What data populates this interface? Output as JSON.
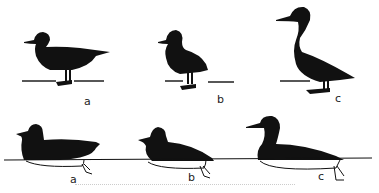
{
  "figure": {
    "ink_color": "#111111",
    "background": "#ffffff",
    "top_row": {
      "description": "Ducks standing on ground, side silhouette",
      "labels": [
        "a",
        "b",
        "c"
      ]
    },
    "bottom_row": {
      "description": "Ducks swimming on water line, submerged body outlined with feet",
      "labels": [
        "a",
        "b",
        "c"
      ]
    }
  }
}
